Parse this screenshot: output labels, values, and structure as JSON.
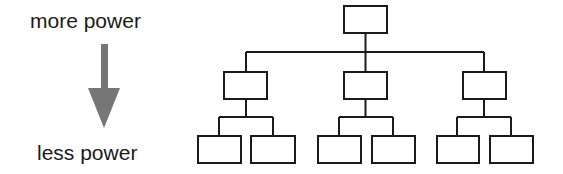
{
  "labels": {
    "top": "more power",
    "bottom": "less power"
  },
  "colors": {
    "line": "#1a1a1a",
    "arrow": "#767676",
    "background": "#ffffff"
  },
  "hierarchy": {
    "levels": 3,
    "root": {
      "children": 3
    },
    "middle": [
      {
        "children": 2
      },
      {
        "children": 2
      },
      {
        "children": 2
      }
    ]
  }
}
